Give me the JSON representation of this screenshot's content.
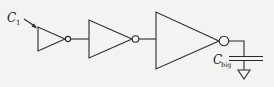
{
  "diagram": {
    "type": "circuit",
    "labels": {
      "input_cap": {
        "main": "C",
        "sub": "1"
      },
      "load_cap": {
        "main": "C",
        "sub": "big"
      }
    },
    "components": [
      {
        "id": "inverter-1",
        "kind": "inverter",
        "size": "small"
      },
      {
        "id": "inverter-2",
        "kind": "inverter",
        "size": "medium"
      },
      {
        "id": "inverter-3",
        "kind": "inverter",
        "size": "large"
      },
      {
        "id": "load-capacitor",
        "kind": "capacitor",
        "label": "C_big"
      },
      {
        "id": "ground",
        "kind": "ground"
      }
    ],
    "colors": {
      "line": "#2a2a2a",
      "background": "#f3f3f1"
    }
  }
}
